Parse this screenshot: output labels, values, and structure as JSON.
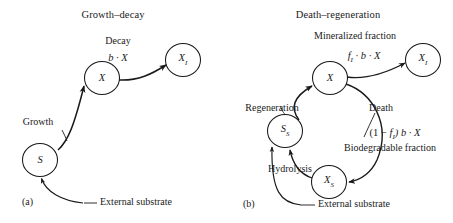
{
  "figure": {
    "background": "#ffffff",
    "stroke_color": "#1a1a1a",
    "text_color": "#1a1a1a"
  },
  "panels": [
    {
      "id": "a",
      "letter": "(a)",
      "title": "Growth–decay",
      "nodes": [
        {
          "id": "S",
          "label": "S",
          "sub": ""
        },
        {
          "id": "X",
          "label": "X",
          "sub": ""
        },
        {
          "id": "XI",
          "label": "X",
          "sub": "I"
        }
      ],
      "labels": [
        {
          "name": "decay-label",
          "text": "Decay"
        },
        {
          "name": "decay-rate-expression",
          "text": "b · X"
        },
        {
          "name": "growth-label",
          "text": "Growth"
        },
        {
          "name": "external-substrate-label",
          "text": "External substrate"
        }
      ]
    },
    {
      "id": "b",
      "letter": "(b)",
      "title": "Death–regeneration",
      "nodes": [
        {
          "id": "SS",
          "label": "S",
          "sub": "S"
        },
        {
          "id": "X",
          "label": "X",
          "sub": ""
        },
        {
          "id": "XI",
          "label": "X",
          "sub": "I"
        },
        {
          "id": "XS",
          "label": "X",
          "sub": "S"
        }
      ],
      "labels": [
        {
          "name": "mineralized-fraction-label",
          "text": "Mineralized fraction"
        },
        {
          "name": "mineralized-rate-expression",
          "text": "f₁ · b · X"
        },
        {
          "name": "death-label",
          "text": "Death"
        },
        {
          "name": "regeneration-label",
          "text": "Regeneration"
        },
        {
          "name": "biodegradable-rate-expression",
          "text": "(1 − f₁) b · X"
        },
        {
          "name": "biodegradable-fraction-label",
          "text": "Biodegradable fraction"
        },
        {
          "name": "hydrolysis-label",
          "text": "Hydrolysis"
        },
        {
          "name": "external-substrate-label",
          "text": "External substrate"
        }
      ]
    }
  ],
  "text": {
    "title_a": "Growth–decay",
    "title_b": "Death–regeneration",
    "decay": "Decay",
    "growth": "Growth",
    "external_substrate_a": "External substrate",
    "external_substrate_b": "External substrate",
    "panel_a": "(a)",
    "panel_b": "(b)",
    "mineralized_fraction": "Mineralized fraction",
    "death": "Death",
    "regeneration": "Regeneration",
    "biodegradable_fraction": "Biodegradable fraction",
    "hydrolysis": "Hydrolysis"
  },
  "math": {
    "b_x_main": "b",
    "b_x_rest": " · X",
    "min_f": "f",
    "min_f_sub": "I",
    "min_rest": " · b · X",
    "bio_open": "(1 − ",
    "bio_f": "f",
    "bio_f_sub": "I",
    "bio_close": ") b · X"
  },
  "node_labels": {
    "s": "S",
    "x_a": "X",
    "xi_a": "X",
    "xi_a_sub": "I",
    "ss": "S",
    "ss_sub": "S",
    "x_b": "X",
    "xi_b": "X",
    "xi_b_sub": "I",
    "xs": "X",
    "xs_sub": "S"
  }
}
